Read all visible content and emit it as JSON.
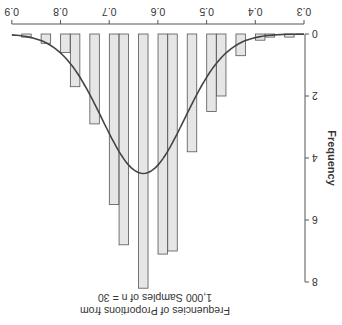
{
  "chart_data": {
    "type": "bar",
    "orientation": "rotated-180",
    "title": "Frequencies of Proportions from 1,000 Samples of n = 30",
    "title_lines": [
      "Frequencies of Proportions from",
      "1,000 Samples of n = 30"
    ],
    "xlabel": "",
    "ylabel": "Frequency",
    "xlim": [
      0.3,
      0.9
    ],
    "ylim": [
      0,
      8
    ],
    "x_ticks": [
      "0.3",
      "0.4",
      "0.5",
      "0.6",
      "0.7",
      "0.8",
      "0.9"
    ],
    "y_ticks": [
      "0",
      "2",
      "4",
      "6",
      "8"
    ],
    "grid": false,
    "legend": null,
    "categories": [
      0.33,
      0.37,
      0.39,
      0.43,
      0.47,
      0.49,
      0.53,
      0.57,
      0.59,
      0.63,
      0.67,
      0.69,
      0.73,
      0.77,
      0.79,
      0.83,
      0.87
    ],
    "values": [
      0.1,
      0.1,
      0.2,
      0.7,
      2.0,
      2.5,
      3.8,
      7.0,
      7.1,
      8.2,
      6.8,
      5.5,
      2.9,
      1.7,
      0.6,
      0.3,
      0.1
    ],
    "overlay": {
      "type": "normal-curve",
      "mean": 0.63,
      "peak": 4.5,
      "sd": 0.085
    },
    "colors": {
      "bar_fill": "#e6e6e6",
      "bar_stroke": "#555555",
      "curve": "#444444",
      "axis": "#555555"
    }
  }
}
